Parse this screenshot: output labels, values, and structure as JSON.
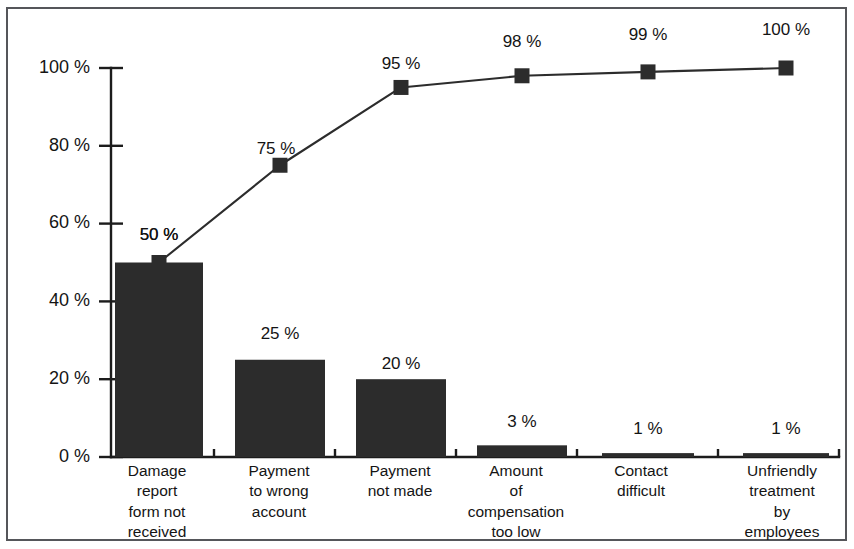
{
  "chart_data": {
    "type": "bar",
    "title": "",
    "subtitle": "",
    "xlabel": "",
    "ylabel": "",
    "ylim": [
      0,
      100
    ],
    "grid": false,
    "legend": null,
    "categories": [
      "Damage\nreport\nform not\nreceived",
      "Payment\nto wrong\naccount",
      "Payment\nnot made",
      "Amount\nof\ncompensation\ntoo low",
      "Contact\ndifficult",
      "Unfriendly\ntreatment\nby\nemployees"
    ],
    "ytick_labels": [
      "0 %",
      "20 %",
      "40 %",
      "60 %",
      "80 %",
      "100 %"
    ],
    "ytick_values": [
      0,
      20,
      40,
      60,
      80,
      100
    ],
    "series": [
      {
        "name": "Share of complaints",
        "type": "bar",
        "values": [
          50,
          25,
          20,
          3,
          1,
          1
        ],
        "labels": [
          "50 %",
          "25 %",
          "20 %",
          "3 %",
          "1 %",
          "1 %"
        ]
      },
      {
        "name": "Cumulative share",
        "type": "line",
        "values": [
          50,
          75,
          95,
          98,
          99,
          100
        ],
        "labels": [
          "50 %",
          "75 %",
          "95 %",
          "98 %",
          "99 %",
          "100 %"
        ]
      }
    ]
  },
  "colors": {
    "bar_fill": "#2c2c2c",
    "line_stroke": "#2c2c2c",
    "axis": "#1c1c1c",
    "frame_border": "#55565a",
    "background": "#ffffff",
    "text": "#141414"
  }
}
